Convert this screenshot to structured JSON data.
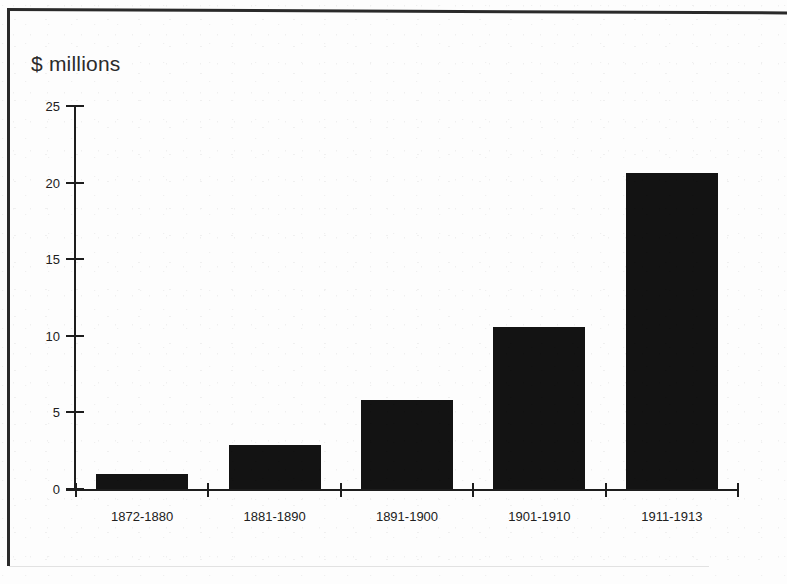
{
  "chart_data": {
    "type": "bar",
    "title": "",
    "subtitle": "",
    "ylabel": "$ millions",
    "xlabel": "",
    "categories": [
      "1872-1880",
      "1881-1890",
      "1891-1900",
      "1901-1910",
      "1911-1913"
    ],
    "values": [
      1.0,
      2.9,
      5.8,
      10.6,
      20.6
    ],
    "series": [
      {
        "name": "$ millions",
        "values": [
          1.0,
          2.9,
          5.8,
          10.6,
          20.6
        ]
      }
    ],
    "ylim": [
      0,
      25
    ],
    "xlim": [
      0,
      5
    ],
    "y_ticks": [
      0,
      5,
      10,
      15,
      20,
      25
    ],
    "y_tick_labels": [
      "0",
      "5",
      "10",
      "15",
      "20",
      "25"
    ],
    "x_tick_labels": [
      "1872-1880",
      "1881-1890",
      "1891-1900",
      "1901-1910",
      "1911-1913"
    ],
    "grid": false,
    "legend": false,
    "legend_position": "none",
    "bar_color": "#131313",
    "axis_color": "#1d1d1d",
    "background_color": "#fdfdfd"
  },
  "figure": {
    "axis_title": "$ millions",
    "frame": "scanned-page-rule"
  }
}
